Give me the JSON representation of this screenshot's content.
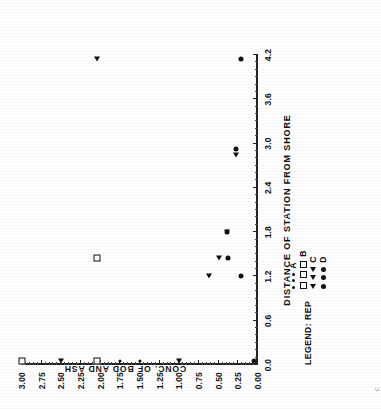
{
  "figure": {
    "x_title": "DISTANCE OF STATION FROM SHORE",
    "y_title": "CONC. OF BOD AND ASH",
    "stray_mark": "c"
  },
  "legend": {
    "title": "LEGEND: REP",
    "groups": [
      {
        "symbol": "A",
        "label": "A",
        "marker": "A",
        "count": 3
      },
      {
        "symbol": "B",
        "label": "B",
        "marker": "B",
        "count": 3
      },
      {
        "symbol": "C",
        "label": "C",
        "marker": "C",
        "count": 3
      },
      {
        "symbol": "D",
        "label": "D",
        "marker": "D",
        "count": 3
      }
    ]
  },
  "chart_data": {
    "type": "scatter",
    "title": "",
    "xlabel": "DISTANCE OF STATION FROM SHORE",
    "ylabel": "CONC. OF BOD AND ASH",
    "xlim": [
      0.0,
      4.2
    ],
    "ylim": [
      0.0,
      3.0
    ],
    "xticks": [
      "0.0",
      "0.6",
      "1.2",
      "1.8",
      "2.4",
      "3.0",
      "3.6",
      "4.2"
    ],
    "xtick_values": [
      0.0,
      0.6,
      1.2,
      1.8,
      2.4,
      3.0,
      3.6,
      4.2
    ],
    "yticks": [
      "0.00",
      "0.25",
      "0.50",
      "0.75",
      "1.00",
      "1.25",
      "1.50",
      "1.75",
      "2.00",
      "2.25",
      "2.50",
      "2.75",
      "3.00"
    ],
    "ytick_values": [
      0.0,
      0.25,
      0.5,
      0.75,
      1.0,
      1.25,
      1.5,
      1.75,
      2.0,
      2.25,
      2.5,
      2.75,
      3.0
    ],
    "grid": false,
    "legend_position": "below-axis",
    "series": [
      {
        "name": "A",
        "marker": "filled-circle-small",
        "points": [
          {
            "x": 0.05,
            "y": 1.5
          },
          {
            "x": 0.05,
            "y": 1.75
          },
          {
            "x": 1.45,
            "y": 2.05
          }
        ]
      },
      {
        "name": "B",
        "marker": "open-square",
        "points": [
          {
            "x": 0.05,
            "y": 3.0
          },
          {
            "x": 0.05,
            "y": 2.05
          },
          {
            "x": 1.45,
            "y": 2.05
          }
        ]
      },
      {
        "name": "C",
        "marker": "left-triangle",
        "points": [
          {
            "x": 0.05,
            "y": 2.5
          },
          {
            "x": 0.05,
            "y": 1.0
          },
          {
            "x": 1.2,
            "y": 0.62
          },
          {
            "x": 1.45,
            "y": 0.5
          },
          {
            "x": 1.8,
            "y": 0.4
          },
          {
            "x": 2.85,
            "y": 0.28
          },
          {
            "x": 4.15,
            "y": 2.05
          }
        ]
      },
      {
        "name": "D",
        "marker": "filled-circle",
        "points": [
          {
            "x": 0.05,
            "y": 0.05
          },
          {
            "x": 1.2,
            "y": 0.22
          },
          {
            "x": 1.45,
            "y": 0.38
          },
          {
            "x": 1.8,
            "y": 0.4
          },
          {
            "x": 2.92,
            "y": 0.28
          },
          {
            "x": 4.15,
            "y": 0.22
          }
        ]
      }
    ]
  }
}
